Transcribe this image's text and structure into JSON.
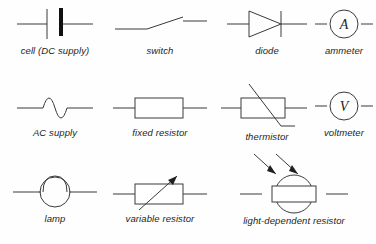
{
  "figure": {
    "background_color": "#fefefe",
    "stroke_color": "#3a3a3c",
    "label_color": "#231f20"
  },
  "rows": [
    {
      "items": [
        {
          "key": "cell",
          "label": "cell (DC supply)",
          "icon": "cell-symbol"
        },
        {
          "key": "switch",
          "label": "switch",
          "icon": "switch-symbol"
        },
        {
          "key": "diode",
          "label": "diode",
          "icon": "diode-symbol"
        },
        {
          "key": "ammeter",
          "label": "ammeter",
          "icon": "ammeter-symbol",
          "meter_letter": "A"
        }
      ]
    },
    {
      "items": [
        {
          "key": "ac_supply",
          "label": "AC supply",
          "icon": "ac-supply-symbol"
        },
        {
          "key": "fixed_resistor",
          "label": "fixed resistor",
          "icon": "fixed-resistor-symbol"
        },
        {
          "key": "thermistor",
          "label": "thermistor",
          "icon": "thermistor-symbol"
        },
        {
          "key": "voltmeter",
          "label": "voltmeter",
          "icon": "voltmeter-symbol",
          "meter_letter": "V"
        }
      ]
    },
    {
      "items": [
        {
          "key": "lamp",
          "label": "lamp",
          "icon": "lamp-symbol"
        },
        {
          "key": "variable_resistor",
          "label": "variable resistor",
          "icon": "variable-resistor-symbol"
        },
        {
          "key": "ldr",
          "label": "light-dependent resistor",
          "icon": "light-dependent-resistor-symbol"
        }
      ]
    }
  ]
}
